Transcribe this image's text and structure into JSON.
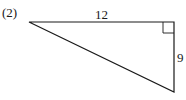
{
  "problem_label": "(2)",
  "triangle": {
    "top_side_label": "12",
    "right_side_label": "9",
    "right_angle": "top-right"
  }
}
